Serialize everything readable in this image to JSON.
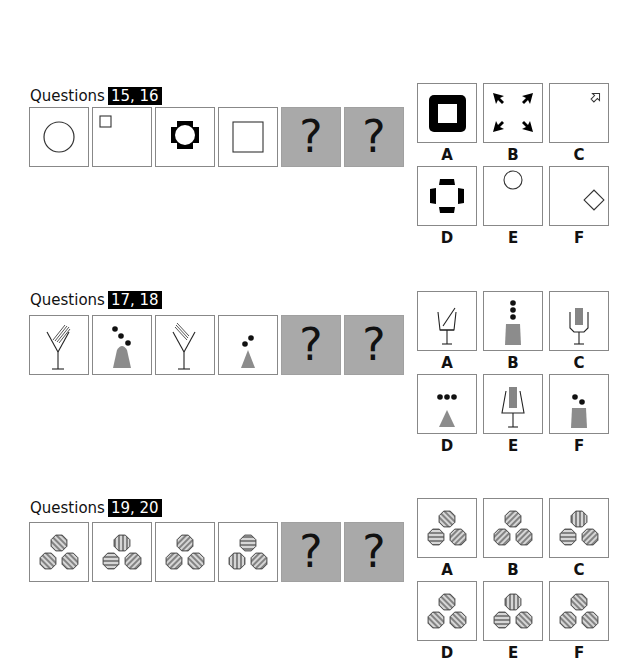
{
  "colors": {
    "gray_fill": "#8c8c8c",
    "hatch_fill": "#d6d6d6",
    "question_bg": "#a9a9a9",
    "label_bg": "#000000"
  },
  "puzzles": [
    {
      "title": "Questions",
      "numbers": "15, 16",
      "sequence": [
        {
          "figure": "circle-outline-center"
        },
        {
          "figure": "small-square-top-left"
        },
        {
          "figure": "black-four-lobed-ring"
        },
        {
          "figure": "square-outline-center"
        },
        {
          "figure": "question",
          "text": "?"
        },
        {
          "figure": "question",
          "text": "?"
        }
      ],
      "options": [
        {
          "label": "A",
          "figure": "thick-black-square-ring"
        },
        {
          "label": "B",
          "figure": "four-black-arrows-inward"
        },
        {
          "label": "C",
          "figure": "small-arrow-outline-top-right"
        },
        {
          "label": "D",
          "figure": "black-four-bars-cross"
        },
        {
          "label": "E",
          "figure": "circle-outline-top"
        },
        {
          "label": "F",
          "figure": "diamond-outline-right"
        }
      ]
    },
    {
      "title": "Questions",
      "numbers": "17, 18",
      "sequence": [
        {
          "figure": "martini-glass-with-hatched-stirrer-right"
        },
        {
          "figure": "gray-bell-with-three-diagonal-dots"
        },
        {
          "figure": "martini-glass-with-hatched-stirrer-left"
        },
        {
          "figure": "gray-triangle-with-two-dots"
        },
        {
          "figure": "question",
          "text": "?"
        },
        {
          "figure": "question",
          "text": "?"
        }
      ],
      "options": [
        {
          "label": "A",
          "figure": "cup-glass-with-one-stick"
        },
        {
          "label": "B",
          "figure": "gray-trapezoid-with-three-vertical-dots"
        },
        {
          "label": "C",
          "figure": "fork-glass-with-four-sticks"
        },
        {
          "label": "D",
          "figure": "gray-triangle-with-three-horizontal-dots"
        },
        {
          "label": "E",
          "figure": "wide-glass-with-four-sticks"
        },
        {
          "label": "F",
          "figure": "gray-trapezoid-with-two-dots"
        }
      ]
    },
    {
      "title": "Questions",
      "numbers": "19, 20",
      "sequence": [
        {
          "figure": "three-hatched-octagons",
          "hatch": [
            "backslash",
            "backslash",
            "backslash"
          ]
        },
        {
          "figure": "three-hatched-octagons",
          "hatch": [
            "vertical",
            "horizontal",
            "slash"
          ]
        },
        {
          "figure": "three-hatched-octagons",
          "hatch": [
            "slash",
            "slash",
            "backslash"
          ]
        },
        {
          "figure": "three-hatched-octagons",
          "hatch": [
            "horizontal",
            "vertical",
            "slash"
          ]
        },
        {
          "figure": "question",
          "text": "?"
        },
        {
          "figure": "question",
          "text": "?"
        }
      ],
      "options": [
        {
          "label": "A",
          "figure": "three-hatched-octagons",
          "hatch": [
            "backslash",
            "horizontal",
            "slash"
          ]
        },
        {
          "label": "B",
          "figure": "three-hatched-octagons",
          "hatch": [
            "slash",
            "slash",
            "slash"
          ]
        },
        {
          "label": "C",
          "figure": "three-hatched-octagons",
          "hatch": [
            "vertical",
            "horizontal",
            "slash"
          ]
        },
        {
          "label": "D",
          "figure": "three-hatched-octagons",
          "hatch": [
            "backslash",
            "backslash",
            "backslash"
          ]
        },
        {
          "label": "E",
          "figure": "three-hatched-octagons",
          "hatch": [
            "vertical",
            "horizontal",
            "backslash"
          ]
        },
        {
          "label": "F",
          "figure": "three-hatched-octagons",
          "hatch": [
            "backslash",
            "backslash",
            "backslash"
          ]
        }
      ]
    }
  ]
}
